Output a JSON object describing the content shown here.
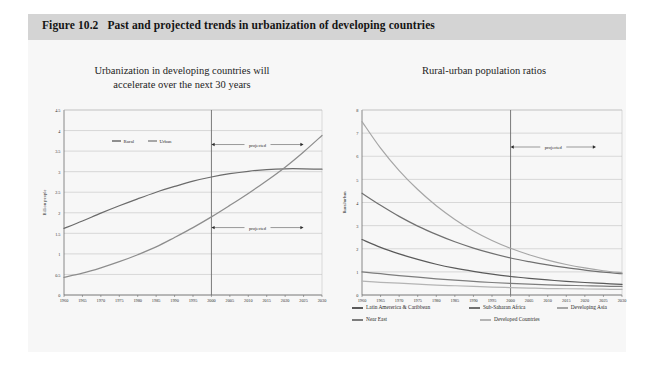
{
  "header": {
    "figure_number": "Figure 10.2",
    "title": "Past and projected trends in urbanization of developing countries"
  },
  "colors": {
    "panel_bg": "#f7f7f7",
    "header_bg": "#d4d4d4",
    "page_bg": "#ffffff",
    "grid": "#b9b9b9",
    "axis": "#6d6d6d",
    "text": "#1d1d1d",
    "rural": "#6b6b6b",
    "urban": "#8d8d8d",
    "latin_america": "#5a5a5a",
    "sub_saharan": "#707070",
    "developing_asia": "#a6a6a6",
    "near_east": "#7d7d7d",
    "developed_countries": "#b4b4b4",
    "divider": "#6d6d6d"
  },
  "chart_data": [
    {
      "id": "left",
      "type": "line",
      "title": "Urbanization in developing countries will accelerate over the next 30 years",
      "title_line1": "Urbanization in developing countries will",
      "title_line2": "accelerate over the next 30 years",
      "xlabel": "",
      "ylabel": "Billion people",
      "x": [
        1960,
        1965,
        1970,
        1975,
        1980,
        1985,
        1990,
        1995,
        2000,
        2005,
        2010,
        2015,
        2020,
        2025,
        2030
      ],
      "xticks": [
        "1960",
        "1965",
        "1970",
        "1975",
        "1980",
        "1985",
        "1990",
        "1995",
        "2000",
        "2005",
        "2010",
        "2015",
        "2020",
        "2025",
        "2030"
      ],
      "yticks": [
        "0",
        "0.5",
        "1",
        "1.5",
        "2",
        "2.5",
        "3",
        "3.5",
        "4",
        "4.5"
      ],
      "ylim": [
        0,
        4.5
      ],
      "xlim": [
        1960,
        2030
      ],
      "grid": true,
      "legend_position": "inside-top-left",
      "series": [
        {
          "name": "Rural",
          "color": "#6b6b6b",
          "values": [
            1.62,
            1.8,
            1.99,
            2.17,
            2.34,
            2.5,
            2.64,
            2.77,
            2.87,
            2.95,
            3.01,
            3.05,
            3.07,
            3.07,
            3.06
          ]
        },
        {
          "name": "Urban",
          "color": "#8d8d8d",
          "values": [
            0.43,
            0.53,
            0.66,
            0.81,
            0.98,
            1.17,
            1.4,
            1.64,
            1.9,
            2.18,
            2.47,
            2.78,
            3.11,
            3.48,
            3.88
          ]
        }
      ],
      "annotations": [
        {
          "text": "projected",
          "x_start": 2000,
          "x_end": 2025,
          "y": 3.66
        },
        {
          "text": "projected",
          "x_start": 2000,
          "x_end": 2025,
          "y": 1.64
        }
      ],
      "divider": {
        "x": 2000
      }
    },
    {
      "id": "right",
      "type": "line",
      "title": "Rural-urban population ratios",
      "xlabel": "",
      "ylabel": "Rural/urban",
      "x": [
        1960,
        1965,
        1970,
        1975,
        1980,
        1985,
        1990,
        1995,
        2000,
        2005,
        2010,
        2015,
        2020,
        2025,
        2030
      ],
      "xticks": [
        "1960",
        "1965",
        "1970",
        "1975",
        "1980",
        "1985",
        "1990",
        "1995",
        "2000",
        "2005",
        "2010",
        "2015",
        "2020",
        "2025",
        "2030"
      ],
      "yticks": [
        "0",
        "1",
        "2",
        "3",
        "4",
        "5",
        "6",
        "7",
        "8"
      ],
      "ylim": [
        0,
        8
      ],
      "xlim": [
        1960,
        2030
      ],
      "grid": true,
      "legend_position": "below",
      "series": [
        {
          "name": "Latin Amererica & Caribbean",
          "color": "#5a5a5a",
          "values": [
            2.4,
            2.06,
            1.78,
            1.54,
            1.33,
            1.16,
            1.02,
            0.9,
            0.8,
            0.72,
            0.65,
            0.59,
            0.54,
            0.5,
            0.46
          ]
        },
        {
          "name": "Sub-Saharan Africa",
          "color": "#707070",
          "values": [
            4.4,
            3.88,
            3.4,
            2.98,
            2.62,
            2.3,
            2.03,
            1.8,
            1.6,
            1.44,
            1.3,
            1.18,
            1.08,
            0.99,
            0.92
          ]
        },
        {
          "name": "Developing Asia",
          "color": "#a6a6a6",
          "values": [
            7.5,
            6.35,
            5.38,
            4.56,
            3.86,
            3.27,
            2.77,
            2.36,
            2.02,
            1.74,
            1.51,
            1.32,
            1.17,
            1.05,
            0.96
          ]
        },
        {
          "name": "Near East",
          "color": "#7d7d7d",
          "values": [
            1.0,
            0.92,
            0.84,
            0.77,
            0.7,
            0.64,
            0.59,
            0.54,
            0.5,
            0.47,
            0.44,
            0.42,
            0.4,
            0.38,
            0.37
          ]
        },
        {
          "name": "Developed Countries",
          "color": "#b4b4b4",
          "values": [
            0.6,
            0.55,
            0.51,
            0.47,
            0.43,
            0.4,
            0.37,
            0.34,
            0.32,
            0.3,
            0.28,
            0.27,
            0.26,
            0.25,
            0.24
          ]
        }
      ],
      "annotations": [
        {
          "text": "projected",
          "x_start": 2000,
          "x_end": 2023,
          "y": 6.4
        }
      ],
      "divider": {
        "x": 2000
      }
    }
  ]
}
